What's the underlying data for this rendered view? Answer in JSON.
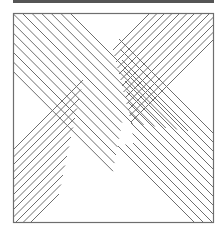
{
  "figure": {
    "colors": {
      "line": "#6e6e6e",
      "frame": "#6e6e6e",
      "topbar": "#555555",
      "background": "#ffffff"
    },
    "frame": {
      "x": 13,
      "y": 13,
      "width": 201,
      "height": 210
    },
    "bands": [
      {
        "name": "backslash-band",
        "direction": "\\",
        "line_count": 13
      },
      {
        "name": "slash-band",
        "direction": "/",
        "line_count": 13
      }
    ]
  }
}
